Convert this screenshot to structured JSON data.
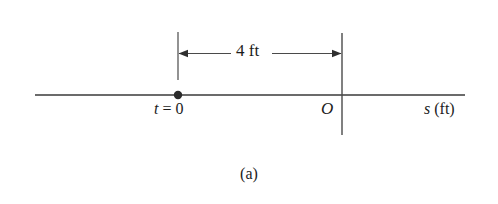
{
  "figure": {
    "caption": "(a)",
    "axis": {
      "variable": "s",
      "unit": "(ft)",
      "origin_label": "O",
      "x_start": 35,
      "x_end": 465,
      "y": 95,
      "stroke": "#3a3a3a",
      "stroke_width": 1.6
    },
    "dimension": {
      "value": "4",
      "unit": "ft",
      "label": "4 ft",
      "x_left": 178,
      "x_right": 342,
      "y": 53,
      "extension_top": 32,
      "extension_bottom": 80,
      "stroke": "#4a4a4a",
      "stroke_width": 1.2
    },
    "marker": {
      "label_variable": "t",
      "label_equals": "=",
      "label_value": "0",
      "label": "t = 0",
      "x": 178,
      "y": 95,
      "radius": 4.2,
      "color": "#2b2b2b"
    },
    "origin_line": {
      "x": 342,
      "y_top": 33,
      "y_bottom": 135,
      "stroke": "#4a4a4a",
      "stroke_width": 1.4
    },
    "background": "#ffffff"
  }
}
